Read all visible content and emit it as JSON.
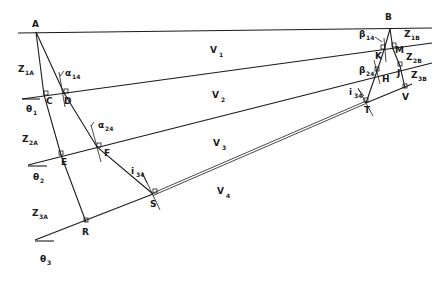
{
  "diagram": {
    "points": {
      "A": "A",
      "B": "B",
      "C": "C",
      "D": "D",
      "E": "E",
      "F": "F",
      "R": "R",
      "S": "S",
      "K": "K",
      "M": "M",
      "H": "H",
      "J": "J",
      "T": "T",
      "V": "V"
    },
    "layers": [
      {
        "main": "V",
        "sub": "1"
      },
      {
        "main": "V",
        "sub": "2"
      },
      {
        "main": "V",
        "sub": "3"
      },
      {
        "main": "V",
        "sub": "4"
      }
    ],
    "thicknesses_A": [
      {
        "main": "Z",
        "sub": "1A"
      },
      {
        "main": "Z",
        "sub": "2A"
      },
      {
        "main": "Z",
        "sub": "3A"
      }
    ],
    "thicknesses_B": [
      {
        "main": "Z",
        "sub": "1B"
      },
      {
        "main": "Z",
        "sub": "2B"
      },
      {
        "main": "Z",
        "sub": "3B"
      }
    ],
    "dips": [
      {
        "main": "θ",
        "sub": "1"
      },
      {
        "main": "θ",
        "sub": "2"
      },
      {
        "main": "θ",
        "sub": "3"
      }
    ],
    "angles": {
      "alpha14": {
        "main": "α",
        "sub": "14"
      },
      "alpha24": {
        "main": "α",
        "sub": "24"
      },
      "i34_left": {
        "main": "i",
        "sub": "34"
      },
      "beta14": {
        "main": "β",
        "sub": "14"
      },
      "beta24": {
        "main": "β",
        "sub": "24"
      },
      "i34_right": {
        "main": "i",
        "sub": "34"
      }
    }
  }
}
